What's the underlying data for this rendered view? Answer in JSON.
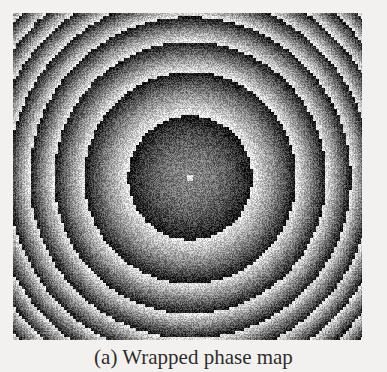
{
  "figure": {
    "caption": "(a) Wrapped phase map",
    "panel_label": "(a)",
    "subject": "wrapped phase map",
    "image_kind": "grayscale-fringe-pattern",
    "background_color": "#f2f1ef",
    "border_color": "#9a9894"
  },
  "phase_map": {
    "pattern": "concentric-circular-wrapped-phase",
    "center_x_frac": 0.508,
    "center_y_frac": 0.504,
    "phase_profile": "quadratic",
    "wrap_count": 8,
    "center_disk_radius_px": 62,
    "ramp_direction": "bright-inner-to-dark-outer",
    "grayscale_min": "#141414",
    "grayscale_max": "#e8e8e8",
    "noise_amount": 0.17,
    "aliasing_step_px": 3,
    "width_px": 349,
    "height_px": 327
  }
}
